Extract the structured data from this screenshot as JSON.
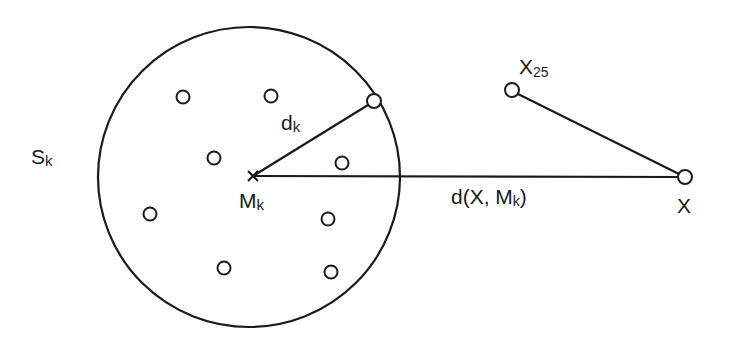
{
  "diagram": {
    "colors": {
      "stroke": "#1a1a1a",
      "background": "#ffffff"
    },
    "sphere": {
      "label": "S",
      "label_sub": "k",
      "center_x": 249,
      "center_y": 177,
      "rx": 151,
      "ry": 150
    },
    "center_point": {
      "label": "M",
      "label_sub": "k",
      "marker": "x-mark",
      "x": 253,
      "y": 176
    },
    "radius": {
      "label": "d",
      "label_sub": "k",
      "end_x": 374,
      "end_y": 101
    },
    "members": [
      {
        "x": 183,
        "y": 97
      },
      {
        "x": 271,
        "y": 96
      },
      {
        "x": 214,
        "y": 158
      },
      {
        "x": 342,
        "y": 163
      },
      {
        "x": 150,
        "y": 214
      },
      {
        "x": 328,
        "y": 219
      },
      {
        "x": 224,
        "y": 268
      },
      {
        "x": 331,
        "y": 272
      }
    ],
    "query_point": {
      "label": "X",
      "x": 685,
      "y": 177
    },
    "neighbor_point": {
      "label": "X",
      "label_sub": "25",
      "x": 512,
      "y": 90
    },
    "distance": {
      "label": "d(X, M",
      "label_sub": "k",
      "label_close": ")"
    }
  }
}
